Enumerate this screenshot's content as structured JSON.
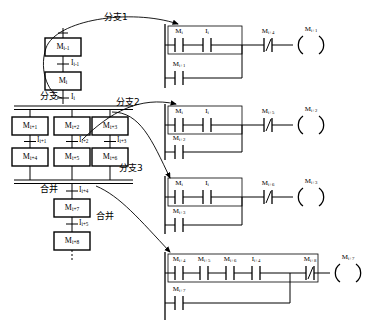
{
  "diagram": {
    "colors": {
      "line": "#000000",
      "background": "#ffffff"
    }
  },
  "sfc": {
    "steps": [
      {
        "id": "s0",
        "label": "M",
        "sub": "i-1"
      },
      {
        "id": "s1",
        "label": "M",
        "sub": "i"
      },
      {
        "id": "s2",
        "label": "M",
        "sub": "i+1"
      },
      {
        "id": "s3",
        "label": "M",
        "sub": "i+2"
      },
      {
        "id": "s4",
        "label": "M",
        "sub": "i+3"
      },
      {
        "id": "s5",
        "label": "M",
        "sub": "i+4"
      },
      {
        "id": "s6",
        "label": "M",
        "sub": "i+5"
      },
      {
        "id": "s7",
        "label": "M",
        "sub": "i+6"
      },
      {
        "id": "s8",
        "label": "M",
        "sub": "i+7"
      },
      {
        "id": "s9",
        "label": "M",
        "sub": "i+8"
      }
    ],
    "transitions": [
      {
        "id": "t0",
        "label": "I",
        "sub": "i-1"
      },
      {
        "id": "t1",
        "label": "I",
        "sub": "i"
      },
      {
        "id": "t2",
        "label": "I",
        "sub": "i+1"
      },
      {
        "id": "t3",
        "label": "I",
        "sub": "i+2"
      },
      {
        "id": "t4",
        "label": "I",
        "sub": "i+3"
      },
      {
        "id": "t5",
        "label": "I",
        "sub": "i+4"
      },
      {
        "id": "t6",
        "label": "I",
        "sub": "i+5"
      }
    ],
    "markers": [
      {
        "id": "m_branch",
        "text": "分支"
      },
      {
        "id": "m_merge",
        "text": "合并"
      }
    ]
  },
  "annotations": [
    {
      "id": "a1",
      "text": "分支1"
    },
    {
      "id": "a2",
      "text": "分支2"
    },
    {
      "id": "a3",
      "text": "分支3"
    },
    {
      "id": "a4",
      "text": "合并"
    }
  ],
  "ladder": {
    "rungs": [
      {
        "id": "rung1",
        "series": [
          {
            "label": "M",
            "sub": "i",
            "type": "no"
          },
          {
            "label": "I",
            "sub": "i",
            "type": "no"
          }
        ],
        "parallel": [
          {
            "label": "M",
            "sub": "i+1",
            "type": "no"
          }
        ],
        "interlock": {
          "label": "M",
          "sub": "i+4",
          "type": "nc"
        },
        "coil": {
          "label": "M",
          "sub": "i+1"
        }
      },
      {
        "id": "rung2",
        "series": [
          {
            "label": "M",
            "sub": "i",
            "type": "no"
          },
          {
            "label": "I",
            "sub": "i",
            "type": "no"
          }
        ],
        "parallel": [
          {
            "label": "M",
            "sub": "i+2",
            "type": "no"
          }
        ],
        "interlock": {
          "label": "M",
          "sub": "i+5",
          "type": "nc"
        },
        "coil": {
          "label": "M",
          "sub": "i+2"
        }
      },
      {
        "id": "rung3",
        "series": [
          {
            "label": "M",
            "sub": "i",
            "type": "no"
          },
          {
            "label": "I",
            "sub": "i",
            "type": "no"
          }
        ],
        "parallel": [
          {
            "label": "M",
            "sub": "i+3",
            "type": "no"
          }
        ],
        "interlock": {
          "label": "M",
          "sub": "i+6",
          "type": "nc"
        },
        "coil": {
          "label": "M",
          "sub": "i+3"
        }
      },
      {
        "id": "rung4",
        "series": [
          {
            "label": "M",
            "sub": "i+4",
            "type": "no"
          },
          {
            "label": "M",
            "sub": "i+5",
            "type": "no"
          },
          {
            "label": "M",
            "sub": "i+6",
            "type": "no"
          },
          {
            "label": "I",
            "sub": "i+4",
            "type": "no"
          }
        ],
        "parallel": [
          {
            "label": "M",
            "sub": "i+7",
            "type": "no"
          }
        ],
        "interlock": {
          "label": "M",
          "sub": "i+8",
          "type": "nc"
        },
        "coil": {
          "label": "M",
          "sub": "i+7"
        }
      }
    ],
    "nc_glyph": "/"
  }
}
